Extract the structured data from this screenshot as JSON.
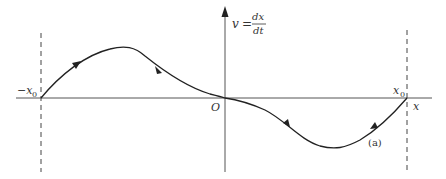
{
  "diagram": {
    "type": "phase-plane",
    "vertical_axis_label": {
      "lhs": "v",
      "equals": "=",
      "numerator": "dx",
      "denominator": "dt"
    },
    "horizontal_axis_label": "x",
    "origin_label": "O",
    "left_bound_label": "−x",
    "left_bound_subscript": "0",
    "right_bound_label": "x",
    "right_bound_subscript": "0",
    "curve_label": "(a)",
    "colors": {
      "axis": "#555555",
      "curve": "#222222",
      "dashed": "#444444",
      "text": "#333333"
    }
  }
}
